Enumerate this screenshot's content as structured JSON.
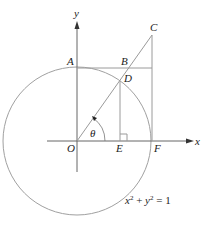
{
  "diagram": {
    "type": "unit-circle-trig-geometry",
    "colors": {
      "line": "#9a9a9a",
      "axis": "#555555",
      "text": "#222222"
    },
    "axes": {
      "x_label": "x",
      "y_label": "y"
    },
    "points": {
      "A": "A",
      "B": "B",
      "C": "C",
      "D": "D",
      "O": "O",
      "E": "E",
      "F": "F"
    },
    "angle_label": "θ",
    "equation": {
      "x": "x",
      "y": "y",
      "exp": "2",
      "plus": " + ",
      "rhs": " = 1"
    }
  }
}
